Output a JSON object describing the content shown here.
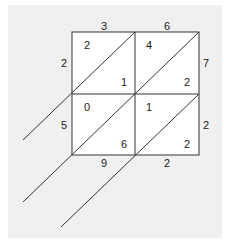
{
  "diagram": {
    "type": "lattice-multiplication",
    "top_digits": [
      "3",
      "6"
    ],
    "right_digits": [
      "7",
      "2"
    ],
    "cells": [
      [
        {
          "upper": "2",
          "lower": "1"
        },
        {
          "upper": "4",
          "lower": "2"
        }
      ],
      [
        {
          "upper": "0",
          "lower": "6"
        },
        {
          "upper": "1",
          "lower": "2"
        }
      ]
    ],
    "left_digits": [
      "2",
      "5"
    ],
    "bottom_digits": [
      "9",
      "2"
    ],
    "right_side_result": [
      "2"
    ],
    "colors": {
      "background": "#f0f0f0",
      "grid": "#333333",
      "cell": "#ffffff"
    }
  }
}
